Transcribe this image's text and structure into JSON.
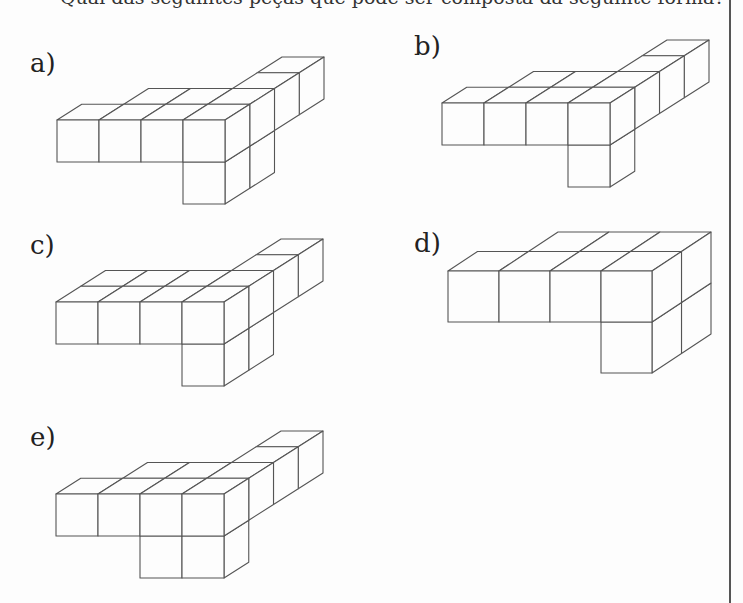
{
  "header": {
    "cropped_question_text": "Qual das seguintes peças que pode ser composta da seguinte forma?"
  },
  "options": [
    {
      "label": "a)",
      "label_pos": [
        30,
        70
      ],
      "origin": [
        57,
        120
      ],
      "cube": 42,
      "depth_vec": [
        24.75,
        -15.75
      ],
      "cubes": [
        [
          0,
          0,
          0
        ],
        [
          1,
          0,
          0
        ],
        [
          2,
          0,
          0
        ],
        [
          3,
          0,
          0
        ],
        [
          1,
          0,
          1
        ],
        [
          2,
          0,
          1
        ],
        [
          3,
          0,
          1
        ],
        [
          3,
          0,
          2
        ],
        [
          3,
          0,
          3
        ],
        [
          3,
          -1,
          0
        ],
        [
          3,
          -1,
          1
        ]
      ]
    },
    {
      "label": "b)",
      "label_pos": [
        414,
        53
      ],
      "origin": [
        442,
        103
      ],
      "cube": 42,
      "depth_vec": [
        24.75,
        -15.75
      ],
      "cubes": [
        [
          0,
          0,
          0
        ],
        [
          1,
          0,
          0
        ],
        [
          2,
          0,
          0
        ],
        [
          3,
          0,
          0
        ],
        [
          1,
          0,
          1
        ],
        [
          2,
          0,
          1
        ],
        [
          3,
          0,
          1
        ],
        [
          3,
          0,
          2
        ],
        [
          3,
          0,
          3
        ],
        [
          3,
          -1,
          0
        ]
      ]
    },
    {
      "label": "c)",
      "label_pos": [
        30,
        252
      ],
      "origin": [
        56,
        302
      ],
      "cube": 42,
      "depth_vec": [
        24.75,
        -15.75
      ],
      "cubes": [
        [
          0,
          0,
          0
        ],
        [
          1,
          0,
          0
        ],
        [
          2,
          0,
          0
        ],
        [
          3,
          0,
          0
        ],
        [
          0,
          0,
          1
        ],
        [
          1,
          0,
          1
        ],
        [
          2,
          0,
          1
        ],
        [
          3,
          0,
          1
        ],
        [
          3,
          0,
          2
        ],
        [
          3,
          0,
          3
        ],
        [
          3,
          -1,
          0
        ],
        [
          3,
          -1,
          1
        ]
      ]
    },
    {
      "label": "d)",
      "label_pos": [
        414,
        250
      ],
      "origin": [
        448,
        271
      ],
      "cube": 51,
      "depth_vec": [
        29.5,
        -19.5
      ],
      "cubes": [
        [
          0,
          0,
          0
        ],
        [
          1,
          0,
          0
        ],
        [
          2,
          0,
          0
        ],
        [
          3,
          0,
          0
        ],
        [
          1,
          0,
          1
        ],
        [
          2,
          0,
          1
        ],
        [
          3,
          0,
          1
        ],
        [
          3,
          -1,
          0
        ],
        [
          3,
          -1,
          1
        ]
      ]
    },
    {
      "label": "e)",
      "label_pos": [
        30,
        444
      ],
      "origin": [
        56,
        494
      ],
      "cube": 42,
      "depth_vec": [
        24.75,
        -15.75
      ],
      "cubes": [
        [
          0,
          0,
          0
        ],
        [
          1,
          0,
          0
        ],
        [
          2,
          0,
          0
        ],
        [
          3,
          0,
          0
        ],
        [
          1,
          0,
          1
        ],
        [
          2,
          0,
          1
        ],
        [
          3,
          0,
          1
        ],
        [
          3,
          0,
          2
        ],
        [
          3,
          0,
          3
        ],
        [
          2,
          -1,
          0
        ],
        [
          3,
          -1,
          0
        ]
      ]
    }
  ],
  "style": {
    "line_color": "#555555",
    "background": "#fdfdfd",
    "rule_x": 729
  }
}
